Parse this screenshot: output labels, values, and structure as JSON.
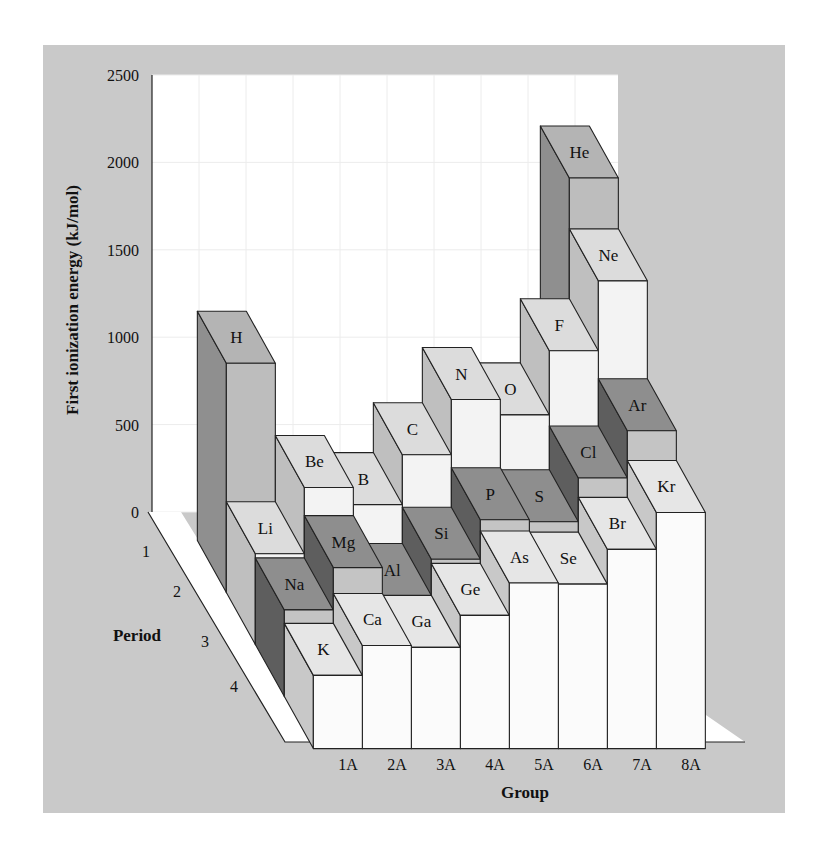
{
  "chart_data": {
    "type": "bar",
    "subtype": "3d-bar",
    "title": "",
    "ylabel": "First ionization energy (kJ/mol)",
    "xlabel": "Group",
    "zlabel": "Period",
    "ylim": [
      0,
      2500
    ],
    "yticks": [
      0,
      500,
      1000,
      1500,
      2000,
      2500
    ],
    "groups": [
      "1A",
      "2A",
      "3A",
      "4A",
      "5A",
      "6A",
      "7A",
      "8A"
    ],
    "periods": [
      "1",
      "2",
      "3",
      "4"
    ],
    "grid": true,
    "bars": [
      {
        "symbol": "H",
        "period": 1,
        "group": 1,
        "value": 1312,
        "shade": "mid"
      },
      {
        "symbol": "He",
        "period": 1,
        "group": 8,
        "value": 2372,
        "shade": "mid"
      },
      {
        "symbol": "Li",
        "period": 2,
        "group": 1,
        "value": 520,
        "shade": "light"
      },
      {
        "symbol": "Be",
        "period": 2,
        "group": 2,
        "value": 899,
        "shade": "light"
      },
      {
        "symbol": "B",
        "period": 2,
        "group": 3,
        "value": 801,
        "shade": "light"
      },
      {
        "symbol": "C",
        "period": 2,
        "group": 4,
        "value": 1086,
        "shade": "light"
      },
      {
        "symbol": "N",
        "period": 2,
        "group": 5,
        "value": 1402,
        "shade": "light"
      },
      {
        "symbol": "O",
        "period": 2,
        "group": 6,
        "value": 1314,
        "shade": "light"
      },
      {
        "symbol": "F",
        "period": 2,
        "group": 7,
        "value": 1681,
        "shade": "light"
      },
      {
        "symbol": "Ne",
        "period": 2,
        "group": 8,
        "value": 2081,
        "shade": "light"
      },
      {
        "symbol": "Na",
        "period": 3,
        "group": 1,
        "value": 496,
        "shade": "dark"
      },
      {
        "symbol": "Mg",
        "period": 3,
        "group": 2,
        "value": 738,
        "shade": "dark"
      },
      {
        "symbol": "Al",
        "period": 3,
        "group": 3,
        "value": 578,
        "shade": "dark"
      },
      {
        "symbol": "Si",
        "period": 3,
        "group": 4,
        "value": 786,
        "shade": "dark"
      },
      {
        "symbol": "P",
        "period": 3,
        "group": 5,
        "value": 1012,
        "shade": "dark"
      },
      {
        "symbol": "S",
        "period": 3,
        "group": 6,
        "value": 1000,
        "shade": "dark"
      },
      {
        "symbol": "Cl",
        "period": 3,
        "group": 7,
        "value": 1251,
        "shade": "dark"
      },
      {
        "symbol": "Ar",
        "period": 3,
        "group": 8,
        "value": 1521,
        "shade": "dark"
      },
      {
        "symbol": "K",
        "period": 4,
        "group": 1,
        "value": 419,
        "shade": "white"
      },
      {
        "symbol": "Ca",
        "period": 4,
        "group": 2,
        "value": 590,
        "shade": "white"
      },
      {
        "symbol": "Ga",
        "period": 4,
        "group": 3,
        "value": 579,
        "shade": "white"
      },
      {
        "symbol": "Ge",
        "period": 4,
        "group": 4,
        "value": 762,
        "shade": "white"
      },
      {
        "symbol": "As",
        "period": 4,
        "group": 5,
        "value": 947,
        "shade": "white"
      },
      {
        "symbol": "Se",
        "period": 4,
        "group": 6,
        "value": 941,
        "shade": "white"
      },
      {
        "symbol": "Br",
        "period": 4,
        "group": 7,
        "value": 1140,
        "shade": "white"
      },
      {
        "symbol": "Kr",
        "period": 4,
        "group": 8,
        "value": 1351,
        "shade": "white"
      }
    ]
  },
  "colors": {
    "panel_bg": "#c9c9c9",
    "wall": "#ffffff",
    "grid": "#ececec",
    "stroke": "#222222",
    "shades": {
      "mid": {
        "top": "#b4b4b4",
        "front": "#bdbdbd",
        "side": "#8f8f8f"
      },
      "light": {
        "top": "#dcdcdc",
        "front": "#f3f3f3",
        "side": "#bfbfbf"
      },
      "dark": {
        "top": "#8e8e8e",
        "front": "#c4c4c4",
        "side": "#5e5e5e"
      },
      "white": {
        "top": "#e6e6e6",
        "front": "#fbfbfb",
        "side": "#c8c8c8"
      }
    }
  }
}
